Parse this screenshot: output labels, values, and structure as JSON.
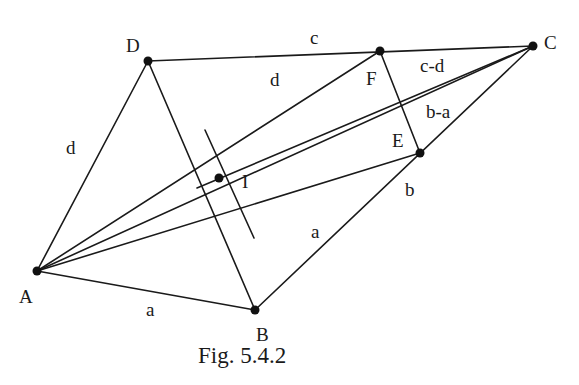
{
  "figure": {
    "caption": "Fig. 5.4.2",
    "points": {
      "A": {
        "label": "A",
        "x": 37,
        "y": 271
      },
      "B": {
        "label": "B",
        "x": 255,
        "y": 310
      },
      "C": {
        "label": "C",
        "x": 533,
        "y": 46
      },
      "D": {
        "label": "D",
        "x": 148,
        "y": 61
      },
      "E": {
        "label": "E",
        "x": 420,
        "y": 153
      },
      "F": {
        "label": "F",
        "x": 380,
        "y": 51
      },
      "I": {
        "label": "I",
        "x": 219,
        "y": 178
      }
    },
    "edge_labels": {
      "AB": "a",
      "BE": "a",
      "EC_lower": "b",
      "AD": "d",
      "DF": "d",
      "DF_top": "c",
      "FC": "c-d",
      "EC": "b-a"
    },
    "segments": [
      {
        "from": "A",
        "to": "B"
      },
      {
        "from": "B",
        "to": "C"
      },
      {
        "from": "C",
        "to": "D"
      },
      {
        "from": "D",
        "to": "A"
      },
      {
        "from": "A",
        "to": "F"
      },
      {
        "from": "A",
        "to": "C"
      },
      {
        "from": "A",
        "to": "E"
      },
      {
        "from": "D",
        "to": "B"
      },
      {
        "from": "F",
        "to": "E"
      },
      {
        "from": "I",
        "to": "C"
      }
    ]
  }
}
